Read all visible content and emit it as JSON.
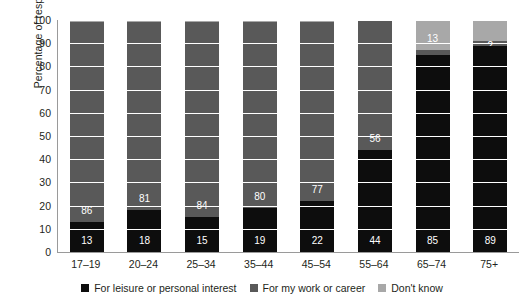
{
  "chart_data": {
    "type": "bar",
    "title": "",
    "subtitle": "",
    "xlabel": "",
    "ylabel": "Percentage of respondents",
    "ylim": [
      0,
      100
    ],
    "ytick_step": 10,
    "grid": true,
    "stacked": true,
    "stack_total": 100,
    "legend_position": "bottom",
    "categories": [
      "17–19",
      "20–24",
      "25–34",
      "35–44",
      "45–54",
      "55–64",
      "65–74",
      "75+"
    ],
    "series": [
      {
        "name": "For leisure or personal interest",
        "color": "#0d0d0d",
        "values": [
          13,
          18,
          15,
          19,
          22,
          44,
          85,
          89
        ],
        "labels": [
          "13",
          "18",
          "15",
          "19",
          "22",
          "44",
          "85",
          "89"
        ]
      },
      {
        "name": "For my work or career",
        "color": "#595959",
        "values": [
          86,
          81,
          84,
          80,
          77,
          56,
          2,
          2
        ],
        "labels": [
          "86",
          "81",
          "84",
          "80",
          "77",
          "56",
          "",
          "2"
        ]
      },
      {
        "name": "Don't know",
        "color": "#a8a8a8",
        "values": [
          1,
          1,
          1,
          1,
          1,
          0,
          13,
          9
        ],
        "labels": [
          "",
          "",
          "",
          "",
          "",
          "",
          "13",
          ""
        ]
      }
    ],
    "ytick_labels": [
      "100",
      "90",
      "80",
      "70",
      "60",
      "50",
      "40",
      "30",
      "20",
      "10",
      "0"
    ]
  },
  "legend": {
    "items": [
      {
        "label": "For leisure or personal interest",
        "swatch": "legend-swatch-leisure"
      },
      {
        "label": "For my work or career",
        "swatch": "legend-swatch-work"
      },
      {
        "label": "Don't know",
        "swatch": "legend-swatch-dontknow"
      }
    ]
  }
}
